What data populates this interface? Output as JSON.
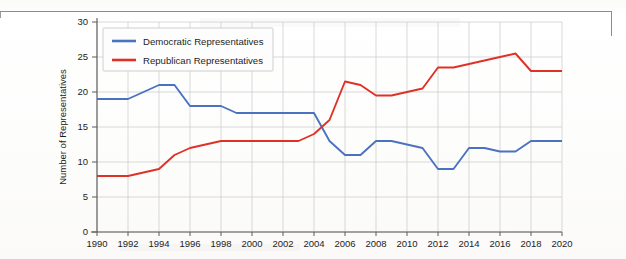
{
  "chart_data": {
    "type": "line",
    "title": "",
    "xlabel": "",
    "ylabel": "Number of Representatives",
    "xlim": [
      1990,
      2020
    ],
    "ylim": [
      0,
      30
    ],
    "ytick_step": 5,
    "xtick_step": 2,
    "grid": true,
    "legend_position": "upper left",
    "x": [
      1990,
      1991,
      1992,
      1993,
      1994,
      1995,
      1996,
      1997,
      1998,
      1999,
      2000,
      2001,
      2002,
      2003,
      2004,
      2005,
      2006,
      2007,
      2008,
      2009,
      2010,
      2011,
      2012,
      2013,
      2014,
      2015,
      2016,
      2017,
      2018,
      2019,
      2020
    ],
    "xticks": [
      "1990",
      "1992",
      "1994",
      "1996",
      "1998",
      "2000",
      "2002",
      "2004",
      "2006",
      "2008",
      "2010",
      "2012",
      "2014",
      "2016",
      "2018",
      "2020"
    ],
    "yticks": [
      "0",
      "5",
      "10",
      "15",
      "20",
      "25",
      "30"
    ],
    "series": [
      {
        "name": "Democratic Representatives",
        "color": "#4A72C0",
        "values": [
          19,
          19,
          19,
          20,
          21,
          21,
          18,
          18,
          18,
          17,
          17,
          17,
          17,
          17,
          17,
          13,
          11,
          11,
          13,
          13,
          12.5,
          12,
          9,
          9,
          12,
          12,
          11.5,
          11.5,
          13,
          13,
          13
        ]
      },
      {
        "name": "Republican Representatives",
        "color": "#E03127",
        "values": [
          8,
          8,
          8,
          8.5,
          9,
          11,
          12,
          12.5,
          13,
          13,
          13,
          13,
          13,
          13,
          14,
          16,
          21.5,
          21,
          19.5,
          19.5,
          20,
          20.5,
          23.5,
          23.5,
          24,
          24.5,
          25,
          25.5,
          23,
          23,
          23
        ]
      }
    ]
  },
  "legend": {
    "items": [
      {
        "label": "Democratic Representatives",
        "color": "#4A72C0"
      },
      {
        "label": "Republican Representatives",
        "color": "#E03127"
      }
    ]
  },
  "axes": {
    "y_axis_title": "Number of Representatives"
  }
}
